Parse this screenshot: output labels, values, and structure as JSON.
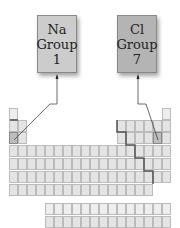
{
  "boxes": [
    {
      "symbol": "Na",
      "line2": "Group",
      "line3": "1",
      "bg": "#cccccc",
      "x": 37,
      "y": 15
    },
    {
      "symbol": "Cl",
      "line2": "Group",
      "line3": "7",
      "bg": "#b4b4b4",
      "x": 117,
      "y": 15
    }
  ],
  "colors": {
    "cell": "#e4e4e4",
    "highlight": "#bdbdbd",
    "staircase": "#555555"
  }
}
